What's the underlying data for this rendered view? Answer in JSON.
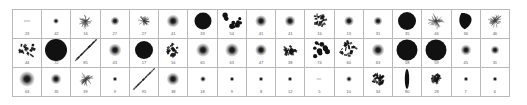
{
  "figure": {
    "kind": "thumbnail-contact-sheet",
    "columns": 17,
    "rows": 3,
    "background": "#ffffff",
    "grid_line_color": "#b9b9b9",
    "ink_color": "#111111",
    "label_color": "#5a5a5a"
  },
  "cells": [
    {
      "id": "r1c1",
      "shape": "faint-dash",
      "size": 7,
      "label": "23"
    },
    {
      "id": "r1c2",
      "shape": "gauss-blob",
      "size": 6,
      "label": "42"
    },
    {
      "id": "r1c3",
      "shape": "scribble",
      "size": 16,
      "label": "16"
    },
    {
      "id": "r1c4",
      "shape": "gauss-blob",
      "size": 9,
      "label": "27"
    },
    {
      "id": "r1c5",
      "shape": "scribble",
      "size": 12,
      "label": "27"
    },
    {
      "id": "r1c6",
      "shape": "gauss-blob",
      "size": 13,
      "label": "41"
    },
    {
      "id": "r1c7",
      "shape": "solid-disc",
      "size": 17,
      "label": "33"
    },
    {
      "id": "r1c8",
      "shape": "dot-cluster",
      "size": 20,
      "label": "54"
    },
    {
      "id": "r1c9",
      "shape": "gauss-blob",
      "size": 12,
      "label": "41"
    },
    {
      "id": "r1c10",
      "shape": "gauss-blob",
      "size": 11,
      "label": "41"
    },
    {
      "id": "r1c11",
      "shape": "crystal-clump",
      "size": 15,
      "label": "16"
    },
    {
      "id": "r1c12",
      "shape": "gauss-blob",
      "size": 10,
      "label": "13"
    },
    {
      "id": "r1c13",
      "shape": "gauss-blob",
      "size": 9,
      "label": "31"
    },
    {
      "id": "r1c14",
      "shape": "solid-disc",
      "size": 18,
      "label": "35"
    },
    {
      "id": "r1c15",
      "shape": "scribble",
      "size": 17,
      "label": "46"
    },
    {
      "id": "r1c16",
      "shape": "teardrop",
      "size": 17,
      "label": "36"
    },
    {
      "id": "r1c17",
      "shape": "scribble",
      "size": 16,
      "label": "46"
    },
    {
      "id": "r2c1",
      "shape": "crystal-clump",
      "size": 18,
      "label": "44"
    },
    {
      "id": "r2c2",
      "shape": "solid-disc",
      "size": 22,
      "label": "72"
    },
    {
      "id": "r2c3",
      "shape": "diagonal-streak",
      "size": 21,
      "label": "85"
    },
    {
      "id": "r2c4",
      "shape": "gauss-blob",
      "size": 13,
      "label": "43"
    },
    {
      "id": "r2c5",
      "shape": "solid-disc",
      "size": 18,
      "label": "17"
    },
    {
      "id": "r2c6",
      "shape": "crystal-clump",
      "size": 14,
      "label": "16"
    },
    {
      "id": "r2c7",
      "shape": "gauss-blob",
      "size": 14,
      "label": "65"
    },
    {
      "id": "r2c8",
      "shape": "gauss-blob",
      "size": 14,
      "label": "63"
    },
    {
      "id": "r2c9",
      "shape": "gauss-blob",
      "size": 12,
      "label": "47"
    },
    {
      "id": "r2c10",
      "shape": "crystal-clump",
      "size": 13,
      "label": "38"
    },
    {
      "id": "r2c11",
      "shape": "dot-cluster",
      "size": 19,
      "label": "74"
    },
    {
      "id": "r2c12",
      "shape": "crystal-clump",
      "size": 19,
      "label": "60"
    },
    {
      "id": "r2c13",
      "shape": "gauss-blob",
      "size": 13,
      "label": "63"
    },
    {
      "id": "r2c14",
      "shape": "solid-disc",
      "size": 21,
      "label": "58"
    },
    {
      "id": "r2c15",
      "shape": "solid-disc",
      "size": 21,
      "label": "59"
    },
    {
      "id": "r2c16",
      "shape": "gauss-blob",
      "size": 11,
      "label": "45"
    },
    {
      "id": "r2c17",
      "shape": "gauss-blob",
      "size": 9,
      "label": "31"
    },
    {
      "id": "r3c1",
      "shape": "gauss-blob",
      "size": 16,
      "label": "63"
    },
    {
      "id": "r3c2",
      "shape": "gauss-blob",
      "size": 11,
      "label": "35"
    },
    {
      "id": "r3c3",
      "shape": "scribble",
      "size": 15,
      "label": "39"
    },
    {
      "id": "r3c4",
      "shape": "gauss-blob",
      "size": 5,
      "label": "9"
    },
    {
      "id": "r3c5",
      "shape": "diagonal-streak",
      "size": 21,
      "label": "95"
    },
    {
      "id": "r3c6",
      "shape": "gauss-blob",
      "size": 13,
      "label": "38"
    },
    {
      "id": "r3c7",
      "shape": "gauss-blob",
      "size": 6,
      "label": "18"
    },
    {
      "id": "r3c8",
      "shape": "gauss-blob",
      "size": 5,
      "label": "9"
    },
    {
      "id": "r3c9",
      "shape": "gauss-blob",
      "size": 5,
      "label": "8"
    },
    {
      "id": "r3c10",
      "shape": "gauss-blob",
      "size": 5,
      "label": "12"
    },
    {
      "id": "r3c11",
      "shape": "faint-dash",
      "size": 5,
      "label": "5"
    },
    {
      "id": "r3c12",
      "shape": "gauss-blob",
      "size": 6,
      "label": "10"
    },
    {
      "id": "r3c13",
      "shape": "crystal-clump",
      "size": 13,
      "label": "34"
    },
    {
      "id": "r3c14",
      "shape": "ellipse-vert",
      "size": 20,
      "label": "80"
    },
    {
      "id": "r3c15",
      "shape": "crystal-clump",
      "size": 10,
      "label": "28"
    },
    {
      "id": "r3c16",
      "shape": "gauss-blob",
      "size": 5,
      "label": "7"
    },
    {
      "id": "r3c17",
      "shape": "gauss-blob",
      "size": 5,
      "label": "6"
    }
  ]
}
